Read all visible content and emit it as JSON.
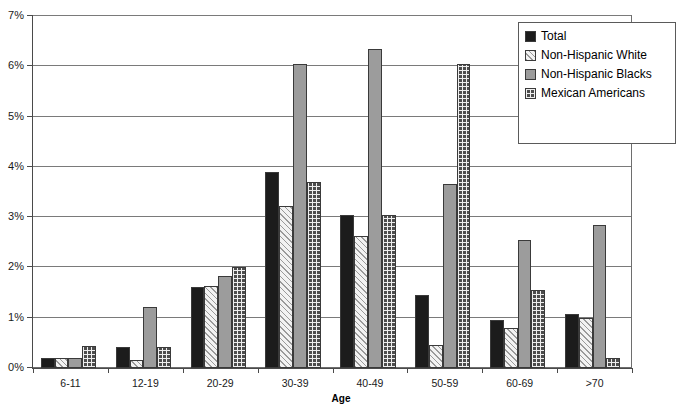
{
  "chart_data": {
    "type": "bar",
    "title": "",
    "xlabel": "Age",
    "ylabel": "",
    "ylim": [
      0,
      7
    ],
    "ytick_labels": [
      "0%",
      "1%",
      "2%",
      "3%",
      "4%",
      "5%",
      "6%",
      "7%"
    ],
    "ytick_values": [
      0,
      1,
      2,
      3,
      4,
      5,
      6,
      7
    ],
    "grid": true,
    "legend_position": "top-right",
    "categories": [
      "6-11",
      "12-19",
      "20-29",
      "30-39",
      "40-49",
      "50-59",
      "60-69",
      ">70"
    ],
    "series": [
      {
        "name": "Total",
        "pattern": "solid-black",
        "color": "#1c1c1c",
        "values": [
          0.2,
          0.42,
          1.62,
          3.9,
          3.05,
          1.45,
          0.95,
          1.07
        ]
      },
      {
        "name": "Non-Hispanic White",
        "pattern": "diagonal-hatch",
        "color": "#f2f2f2",
        "values": [
          0.2,
          0.15,
          1.63,
          3.22,
          2.62,
          0.45,
          0.8,
          1.0
        ]
      },
      {
        "name": "Non-Hispanic Blacks",
        "pattern": "solid-gray",
        "color": "#9c9c9c",
        "values": [
          0.2,
          1.22,
          1.82,
          6.05,
          6.35,
          3.65,
          2.55,
          2.85
        ]
      },
      {
        "name": "Mexican Americans",
        "pattern": "checkered-grid",
        "color": "#4d4d4d",
        "values": [
          0.43,
          0.42,
          2.0,
          3.7,
          3.05,
          6.05,
          1.55,
          0.2
        ]
      }
    ]
  },
  "legend": {
    "entries": [
      {
        "label": "Total"
      },
      {
        "label": "Non-Hispanic White"
      },
      {
        "label": "Non-Hispanic Blacks"
      },
      {
        "label": "Mexican Americans"
      }
    ]
  },
  "axis": {
    "x_title": "Age"
  }
}
